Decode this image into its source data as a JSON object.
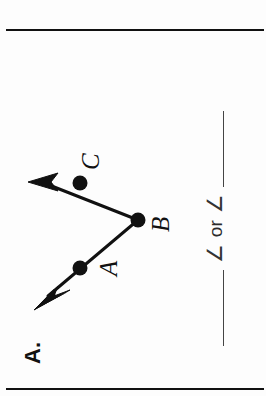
{
  "page": {
    "background_color": "#fdfdfd",
    "ink_color": "#111111",
    "rule_color": "#111111",
    "rotation_degrees": -90
  },
  "problem": {
    "number_label": "A."
  },
  "diagram": {
    "type": "angle-with-two-rays",
    "vertex": "B",
    "points": [
      {
        "id": "A",
        "label": "A",
        "x": 100,
        "y": 62,
        "kind": "ray-endpoint-dot"
      },
      {
        "id": "B",
        "label": "B",
        "x": 148,
        "y": 120,
        "kind": "vertex-dot"
      },
      {
        "id": "C",
        "label": "C",
        "x": 185,
        "y": 62,
        "kind": "ray-endpoint-dot"
      }
    ],
    "rays": [
      {
        "id": "ray-BA",
        "from": "B",
        "to": "A",
        "arrow_tip": {
          "x": 60,
          "y": 20
        }
      },
      {
        "id": "ray-BC",
        "from": "B",
        "to": "C",
        "arrow_tip": {
          "x": 185,
          "y": 12
        }
      }
    ],
    "dot_radius": 7,
    "stroke_width": 3
  },
  "answer_line": {
    "blank_1": "",
    "angle_symbol_1": "∠",
    "or_text": "or",
    "angle_symbol_2": "∠",
    "blank_2": ""
  },
  "icons": {
    "angle_icon": "angle-symbol",
    "blank_icon": "answer-blank-line"
  }
}
